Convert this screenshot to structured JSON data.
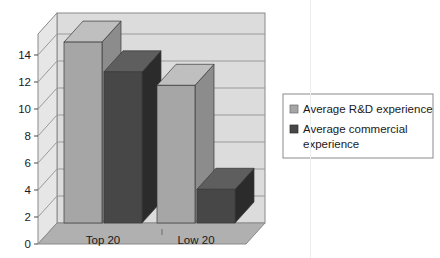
{
  "chart_data": {
    "type": "bar",
    "title": "",
    "subtitle": "",
    "xlabel": "",
    "ylabel": "",
    "categories": [
      "Top 20",
      "Low 20"
    ],
    "series": [
      {
        "name": "Average R&D experience",
        "color": "#A6A6A6",
        "values": [
          13.4,
          10.2
        ]
      },
      {
        "name": "Average commercial experience",
        "color": "#474747",
        "values": [
          11.2,
          2.5
        ]
      }
    ],
    "ylim": [
      0,
      14
    ],
    "yticks": [
      0,
      2,
      4,
      6,
      8,
      10,
      12,
      14
    ],
    "ytick_labels": [
      "0",
      "2",
      "4",
      "6",
      "8",
      "10",
      "12",
      "14"
    ],
    "grid": true,
    "grid_axis": "y",
    "three_d": true,
    "legend_position": "right",
    "legend": [
      {
        "label": "Average R&D experience",
        "swatch": "#A6A6A6"
      },
      {
        "label": "Average commercial experience",
        "swatch": "#474747"
      }
    ]
  },
  "axis": {
    "y_labels": [
      "14",
      "12",
      "10",
      "8",
      "6",
      "4",
      "2",
      "0"
    ],
    "x_labels": [
      "Top 20",
      "Low 20"
    ]
  },
  "legend": {
    "line1": "Average R&D experience",
    "line2a": "Average commercial",
    "line2b": "experience"
  },
  "colors": {
    "series1_front": "#A6A6A6",
    "series1_top": "#BFBFBF",
    "series1_side": "#8C8C8C",
    "series2_front": "#474747",
    "series2_top": "#5E5E5E",
    "series2_side": "#2B2B2B",
    "wall": "#DCDCDC",
    "sidewall": "#E6E6E6",
    "floor": "#B0B0B0",
    "grid": "#9A9A9A",
    "frame": "#8A8A8A",
    "text": "#1a1a1a",
    "legend_border": "#8A8A8A"
  }
}
